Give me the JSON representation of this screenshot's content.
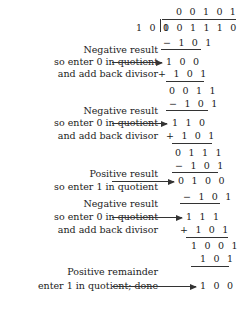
{
  "quotient": "0 0 1 0 1",
  "divisor": "1 0 1",
  "dividend": "0 0 1 1 1 0 1",
  "steps": [
    {
      "op": "− 1 0 1",
      "result": "1 0 0",
      "labels": [
        "Negative result",
        "so enter 0 in quotient",
        "and add back divisor"
      ],
      "restore": "+ 1 0 1"
    },
    {
      "bring": "0 0 1 1",
      "op": "− 1 0 1",
      "result": "1 1 0",
      "labels": [
        "Negative result",
        "so enter 0 in quotient",
        "and add back divisor"
      ],
      "restore": "+ 1 0 1"
    },
    {
      "bring": "0 1 1 1",
      "op": "− 1 0 1",
      "result": "0 1 0 0",
      "labels": [
        "Positive result",
        "so enter 1 in quotient"
      ]
    },
    {
      "op": "− 1 0 1",
      "result": "1 1 1",
      "labels": [
        "Negative result",
        "so enter 0 in quotient",
        "and add back divisor"
      ],
      "restore": "+ 1 0 1"
    },
    {
      "bring": "1 0 0 1",
      "op": "1 0 1",
      "result": "1 0 0",
      "labels": [
        "Positive remainder",
        "enter 1 in quotient; done"
      ]
    }
  ]
}
